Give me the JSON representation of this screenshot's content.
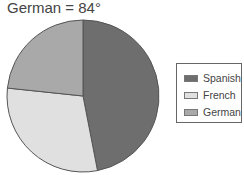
{
  "chart_data": {
    "type": "pie",
    "title": "German = 84°",
    "categories": [
      "Spanish",
      "French",
      "German"
    ],
    "values": [
      169,
      107,
      84
    ],
    "units": "degrees",
    "colors": [
      "#6e6e6e",
      "#e0e0e0",
      "#a9a9a9"
    ],
    "legend_position": "right",
    "start_angle": "top, clockwise"
  },
  "title": "German = 84°",
  "legend": {
    "items": [
      {
        "label": "Spanish",
        "color": "#6e6e6e"
      },
      {
        "label": "French",
        "color": "#e0e0e0"
      },
      {
        "label": "German",
        "color": "#a9a9a9"
      }
    ]
  }
}
